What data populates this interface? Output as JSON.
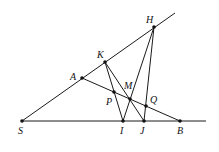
{
  "figure": {
    "type": "geometry-diagram",
    "points": {
      "S": "S",
      "A": "A",
      "K": "K",
      "H": "H",
      "I": "I",
      "J": "J",
      "B": "B",
      "M": "M",
      "P": "P",
      "Q": "Q"
    },
    "segments": [
      [
        "S",
        "H"
      ],
      [
        "S",
        "B"
      ],
      [
        "A",
        "B"
      ],
      [
        "K",
        "I"
      ],
      [
        "K",
        "J"
      ],
      [
        "H",
        "I"
      ],
      [
        "H",
        "J"
      ]
    ],
    "colors": {
      "stroke": "#1a1a1a",
      "background": "#ffffff"
    }
  }
}
